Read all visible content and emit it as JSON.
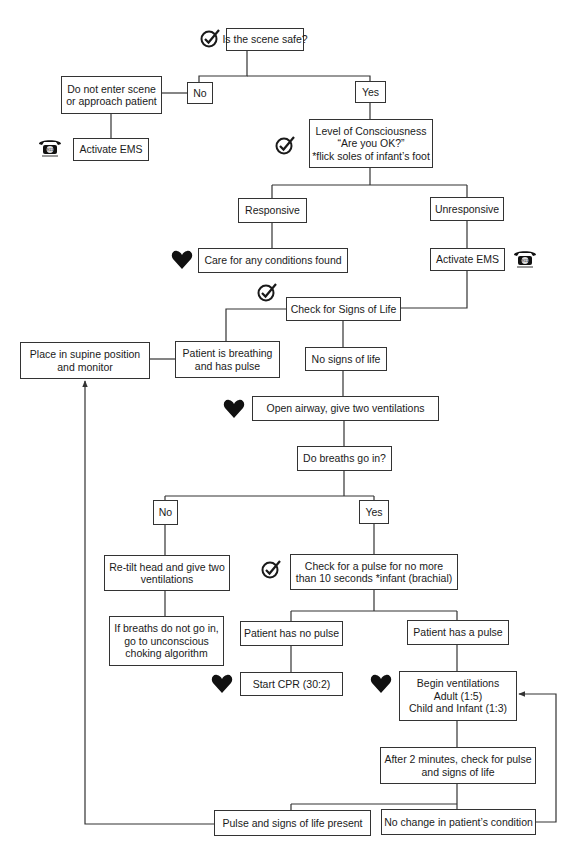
{
  "colors": {
    "line": "#333333",
    "box_border": "#333333",
    "icon": "#1a1a1a",
    "background": "#ffffff"
  },
  "nodes": {
    "scene_safe": {
      "lines": [
        "Is the scene safe?"
      ]
    },
    "no_1": {
      "lines": [
        "No"
      ]
    },
    "yes_1": {
      "lines": [
        "Yes"
      ]
    },
    "do_not_enter": {
      "lines": [
        "Do not enter scene",
        "or approach patient"
      ]
    },
    "activate_ems_left": {
      "lines": [
        "Activate EMS"
      ]
    },
    "level_consciousness": {
      "lines": [
        "Level of Consciousness",
        "“Are you OK?”",
        "*flick soles of infant’s foot"
      ]
    },
    "responsive": {
      "lines": [
        "Responsive"
      ]
    },
    "unresponsive": {
      "lines": [
        "Unresponsive"
      ]
    },
    "care_conditions": {
      "lines": [
        "Care for any conditions found"
      ]
    },
    "activate_ems_right": {
      "lines": [
        "Activate EMS"
      ]
    },
    "check_signs_life": {
      "lines": [
        "Check for Signs of Life"
      ]
    },
    "place_supine": {
      "lines": [
        "Place in supine position",
        "and monitor"
      ]
    },
    "breathing_pulse": {
      "lines": [
        "Patient is breathing",
        "and has pulse"
      ]
    },
    "no_signs_life": {
      "lines": [
        "No signs of life"
      ]
    },
    "open_airway": {
      "lines": [
        "Open airway, give two ventilations"
      ]
    },
    "breaths_go_in": {
      "lines": [
        "Do breaths go in?"
      ]
    },
    "no_2": {
      "lines": [
        "No"
      ]
    },
    "yes_2": {
      "lines": [
        "Yes"
      ]
    },
    "retilt_head": {
      "lines": [
        "Re-tilt head and give two",
        "ventilations"
      ]
    },
    "check_pulse": {
      "lines": [
        "Check for a pulse for no more",
        "than 10 seconds *infant (brachial)"
      ]
    },
    "choking_algorithm": {
      "lines": [
        "If breaths do not go in,",
        "go to unconscious",
        "choking algorithm"
      ]
    },
    "no_pulse": {
      "lines": [
        "Patient has no pulse"
      ]
    },
    "has_pulse": {
      "lines": [
        "Patient has a pulse"
      ]
    },
    "start_cpr": {
      "lines": [
        "Start CPR (30:2)"
      ]
    },
    "begin_ventilations": {
      "lines": [
        "Begin ventilations",
        "Adult (1:5)",
        "Child and Infant (1:3)"
      ]
    },
    "after_2_minutes": {
      "lines": [
        "After 2 minutes, check for pulse",
        "and signs of life"
      ]
    },
    "pulse_present": {
      "lines": [
        "Pulse and signs of life present"
      ]
    },
    "no_change": {
      "lines": [
        "No change in patient’s condition"
      ]
    }
  },
  "icons": {
    "check": "check-circle-icon",
    "heart": "heart-icon",
    "phone": "telephone-911-icon",
    "phone_label": "911"
  }
}
